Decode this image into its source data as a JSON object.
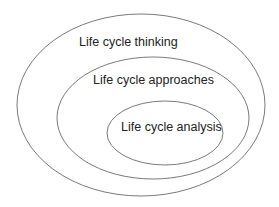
{
  "diagram": {
    "type": "nested-ellipses",
    "stroke_color": "#6b6b6b",
    "text_color": "#222222",
    "levels": [
      {
        "label": "Life cycle thinking"
      },
      {
        "label": "Life cycle approaches"
      },
      {
        "label": "Life cycle analysis"
      }
    ]
  }
}
